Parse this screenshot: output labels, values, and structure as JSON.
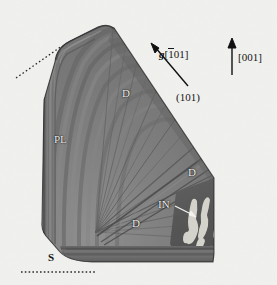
{
  "figure": {
    "kind": "electron-micrograph",
    "background_color": "#f4f4f2",
    "specimen_fill": "#6f6f6f",
    "specimen_dark": "#3b3b3b",
    "inclusion_color": "#ecebe4"
  },
  "annotations": {
    "g_vector": {
      "symbol": "g",
      "open_bracket": "[",
      "overbar_index": "1",
      "rest_index": "01",
      "close_bracket": "]",
      "full": "g[101]"
    },
    "direction_arrow": {
      "label": "[001]"
    },
    "plane_label": {
      "label": "(101)"
    },
    "phase_labels": [
      {
        "id": "d-upper",
        "label": "D",
        "style": "light"
      },
      {
        "id": "pl",
        "label": "PL",
        "style": "light"
      },
      {
        "id": "d-right",
        "label": "D",
        "style": "light"
      },
      {
        "id": "d-lower",
        "label": "D",
        "style": "light"
      },
      {
        "id": "in",
        "label": "IN",
        "style": "light"
      },
      {
        "id": "s",
        "label": "S",
        "style": "dark"
      }
    ]
  },
  "markers": {
    "upper_left_dotted_line": "dotted-reference-line",
    "bottom_dotted_line": "dotted-reference-line",
    "in_pointer": "white-arrow-pointer",
    "g_pointer": "black-arrow-pointer",
    "up_pointer": "black-arrow-pointer"
  }
}
